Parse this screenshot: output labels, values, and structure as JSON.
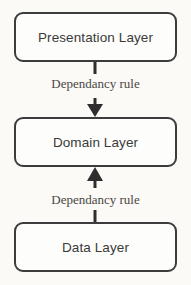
{
  "diagram": {
    "boxes": [
      {
        "id": "presentation",
        "label": "Presentation Layer"
      },
      {
        "id": "domain",
        "label": "Domain Layer"
      },
      {
        "id": "data",
        "label": "Data Layer"
      }
    ],
    "connectors": [
      {
        "id": "presentation-to-domain",
        "label": "Dependancy rule",
        "direction": "down",
        "from": "Presentation Layer",
        "to": "Domain Layer"
      },
      {
        "id": "data-to-domain",
        "label": "Dependancy rule",
        "direction": "up",
        "from": "Data Layer",
        "to": "Domain Layer"
      }
    ],
    "colors": {
      "background": "#fbfaf7",
      "box_fill": "#fdfdfb",
      "box_border": "#3c3c3c",
      "box_text": "#3a3a3a",
      "label_text": "#4a4744",
      "arrow": "#2e2e2e"
    }
  }
}
